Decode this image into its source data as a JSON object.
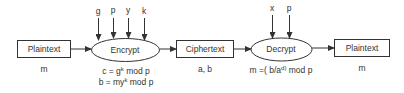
{
  "diagram": {
    "type": "ElGamal encryption flow",
    "nodes": {
      "plaintext_in": {
        "label": "Plaintext",
        "below": "m"
      },
      "encrypt": {
        "label": "Encrypt",
        "inputs": [
          "g",
          "p",
          "y",
          "k"
        ],
        "formula_c_pre": "c = g",
        "formula_c_exp": "k",
        "formula_c_post": " mod p",
        "formula_b_pre": "b = my",
        "formula_b_exp": "k",
        "formula_b_post": " mod p"
      },
      "ciphertext": {
        "label": "Ciphertext",
        "below": "a, b"
      },
      "decrypt": {
        "label": "Decrypt",
        "inputs": [
          "x",
          "p"
        ],
        "formula_pre": "m =( b/a",
        "formula_exp": "d)",
        "formula_post": " mod p"
      },
      "plaintext_out": {
        "label": "Plaintext",
        "below": "m"
      }
    },
    "colors": {
      "stroke": "#333333",
      "background": "#ffffff"
    }
  }
}
